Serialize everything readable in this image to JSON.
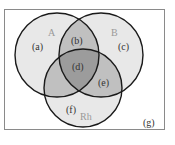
{
  "diagram": {
    "type": "venn",
    "colors": {
      "frame": "#8a8a8a",
      "outline": "#1a1a1a",
      "single": "#e8e8e8",
      "double": "#c0c0c0",
      "triple": "#9c9c9c",
      "background": "#ffffff"
    },
    "sets": [
      {
        "name": "A",
        "label": "A"
      },
      {
        "name": "B",
        "label": "B"
      },
      {
        "name": "Rh",
        "label": "Rh"
      }
    ],
    "regions": [
      {
        "id": "a",
        "label": "(a)",
        "members": [
          "A"
        ]
      },
      {
        "id": "b",
        "label": "(b)",
        "members": [
          "A",
          "B"
        ]
      },
      {
        "id": "c",
        "label": "(c)",
        "members": [
          "B"
        ]
      },
      {
        "id": "d",
        "label": "(d)",
        "members": [
          "A",
          "B",
          "Rh"
        ]
      },
      {
        "id": "e",
        "label": "(e)",
        "members": [
          "B",
          "Rh"
        ]
      },
      {
        "id": "f",
        "label": "(f)",
        "members": [
          "Rh"
        ]
      },
      {
        "id": "g",
        "label": "(g)",
        "members": []
      }
    ]
  }
}
